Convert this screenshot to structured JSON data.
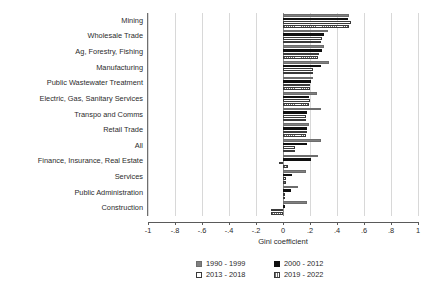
{
  "chart_data": {
    "type": "bar",
    "orientation": "horizontal",
    "title": "",
    "subtitle": "",
    "xlabel": "Gini coefficient",
    "ylabel": "",
    "xlim": [
      -1,
      1
    ],
    "xticks": [
      -1,
      -0.8,
      -0.6,
      -0.4,
      -0.2,
      0,
      0.2,
      0.4,
      0.6,
      0.8,
      1
    ],
    "xticklabels": [
      "-1",
      "-.8",
      "-.6",
      "-.4",
      "-.2",
      "0",
      ".2",
      ".4",
      ".6",
      ".8",
      "1"
    ],
    "grid": "vertical",
    "legend_position": "bottom",
    "categories": [
      "Mining",
      "Wholesale Trade",
      "Ag, Forestry, Fishing",
      "Manufacturing",
      "Public Wastewater Treatment",
      "Electric, Gas, Sanitary Services",
      "Transpo and Comms",
      "Retail Trade",
      "All",
      "Finance, Insurance, Real Estate",
      "Services",
      "Public Administration",
      "Construction"
    ],
    "series": [
      {
        "name": "1990 - 1999",
        "color": "#808080",
        "pattern": "solid-gray",
        "values": [
          0.49,
          0.33,
          0.3,
          0.34,
          0.22,
          0.25,
          0.28,
          0.19,
          0.28,
          0.26,
          0.17,
          0.11,
          0.18
        ]
      },
      {
        "name": "2000 - 2012",
        "color": "#101010",
        "pattern": "solid-black",
        "values": [
          0.48,
          0.3,
          0.29,
          0.28,
          0.21,
          0.19,
          0.18,
          0.18,
          0.18,
          0.21,
          0.07,
          0.06,
          0.005
        ]
      },
      {
        "name": "2013 - 2018",
        "color": "#ffffff",
        "pattern": "empty",
        "values": [
          0.5,
          0.29,
          0.27,
          0.22,
          0.2,
          0.2,
          0.17,
          0.18,
          0.09,
          -0.03,
          0.02,
          0.01,
          -0.09
        ]
      },
      {
        "name": "2019 - 2022",
        "color": "#ffffff",
        "pattern": "vertical-hatch",
        "values": [
          0.49,
          0.28,
          0.26,
          0.22,
          0.2,
          0.19,
          0.17,
          0.17,
          0.09,
          0.04,
          0.02,
          0.01,
          -0.09
        ]
      }
    ]
  },
  "axis": {
    "x_title": "Gini coefficient"
  },
  "legend": {
    "entries": [
      {
        "label": "1990 - 1999",
        "swatch": "legend-swatch-1990-1999"
      },
      {
        "label": "2000 - 2012",
        "swatch": "legend-swatch-2000-2012"
      },
      {
        "label": "2013 - 2018",
        "swatch": "legend-swatch-2013-2018"
      },
      {
        "label": "2019 - 2022",
        "swatch": "legend-swatch-2019-2022"
      }
    ]
  }
}
